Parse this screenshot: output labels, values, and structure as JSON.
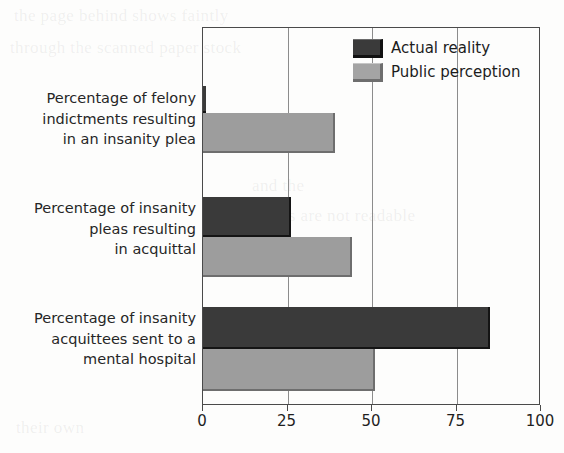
{
  "chart_data": {
    "type": "bar",
    "orientation": "horizontal",
    "title": "",
    "xlabel": "",
    "ylabel": "",
    "xlim": [
      0,
      100
    ],
    "xticks": [
      0,
      25,
      50,
      75,
      100
    ],
    "xtick_labels": [
      "0",
      "25",
      "50",
      "75",
      "100"
    ],
    "grid": true,
    "grid_axis": "x",
    "legend_position": "top-right",
    "categories": [
      "Percentage of felony indictments resulting in an insanity plea",
      "Percentage of insanity pleas resulting in acquittal",
      "Percentage of insanity acquittees sent to a mental hospital"
    ],
    "category_lines": [
      [
        "Percentage of felony",
        "indictments resulting",
        "in an insanity plea"
      ],
      [
        "Percentage of insanity",
        "pleas resulting",
        "in acquittal"
      ],
      [
        "Percentage of insanity",
        "acquittees sent to a",
        "mental hospital"
      ]
    ],
    "series": [
      {
        "name": "Actual reality",
        "color": "#3a3a3a",
        "values": [
          1,
          26,
          85
        ]
      },
      {
        "name": "Public perception",
        "color": "#9d9d9d",
        "values": [
          39,
          44,
          51
        ]
      }
    ]
  },
  "legend": {
    "items": [
      {
        "label": "Actual reality",
        "swatch": "dark"
      },
      {
        "label": "Public perception",
        "swatch": "light"
      }
    ]
  },
  "colors": {
    "actual_reality": "#3a3a3a",
    "public_perception": "#9d9d9d",
    "axis": "#4a4a4a",
    "gridline": "#8c8c8c",
    "background": "#fdfdfc",
    "text": "#262626"
  },
  "background_bleed": [
    "the page behind shows faintly",
    "through the scanned paper stock",
    "and the",
    "text lines are not readable",
    "insanity plea",
    "their own"
  ]
}
